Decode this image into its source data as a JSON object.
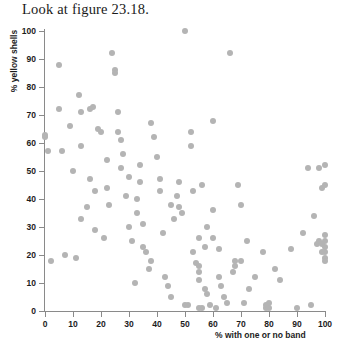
{
  "caption": "Look at figure 23.18.",
  "chart_data": {
    "type": "scatter",
    "title": "",
    "xlabel": "% with one or no band",
    "ylabel": "% yellow shells",
    "xlim": [
      0,
      100
    ],
    "ylim": [
      0,
      100
    ],
    "xticks": [
      0,
      10,
      20,
      30,
      40,
      50,
      60,
      70,
      80,
      90,
      100
    ],
    "yticks": [
      0,
      10,
      20,
      30,
      40,
      50,
      60,
      70,
      80,
      90,
      100
    ],
    "grid": false,
    "legend": null,
    "marker": {
      "shape": "circle",
      "color": "#b4b4b4",
      "size": 6
    },
    "points": [
      [
        0,
        62
      ],
      [
        0,
        63
      ],
      [
        1,
        57
      ],
      [
        2,
        18
      ],
      [
        5,
        72
      ],
      [
        5,
        88
      ],
      [
        6,
        57
      ],
      [
        7,
        20
      ],
      [
        9,
        66
      ],
      [
        10,
        50
      ],
      [
        11,
        19
      ],
      [
        12,
        77
      ],
      [
        13,
        71
      ],
      [
        13,
        59
      ],
      [
        13,
        33
      ],
      [
        15,
        37
      ],
      [
        16,
        47
      ],
      [
        16,
        72
      ],
      [
        17,
        73
      ],
      [
        18,
        43
      ],
      [
        18,
        29
      ],
      [
        19,
        65
      ],
      [
        20,
        64
      ],
      [
        21,
        26
      ],
      [
        22,
        54
      ],
      [
        22,
        44
      ],
      [
        23,
        38
      ],
      [
        24,
        92
      ],
      [
        25,
        86
      ],
      [
        25,
        85
      ],
      [
        26,
        71
      ],
      [
        26,
        64
      ],
      [
        27,
        61
      ],
      [
        27,
        51
      ],
      [
        28,
        56
      ],
      [
        29,
        41
      ],
      [
        30,
        48
      ],
      [
        30,
        30
      ],
      [
        31,
        25
      ],
      [
        32,
        10
      ],
      [
        33,
        35
      ],
      [
        33,
        40
      ],
      [
        34,
        52
      ],
      [
        34,
        46
      ],
      [
        35,
        31
      ],
      [
        35,
        23
      ],
      [
        36,
        21
      ],
      [
        37,
        15
      ],
      [
        38,
        18
      ],
      [
        38,
        67
      ],
      [
        39,
        62
      ],
      [
        40,
        55
      ],
      [
        41,
        47
      ],
      [
        41,
        43
      ],
      [
        42,
        28
      ],
      [
        43,
        12
      ],
      [
        44,
        9
      ],
      [
        45,
        5
      ],
      [
        45,
        38
      ],
      [
        46,
        33
      ],
      [
        47,
        41
      ],
      [
        48,
        46
      ],
      [
        48,
        37
      ],
      [
        49,
        35
      ],
      [
        50,
        100
      ],
      [
        50,
        2
      ],
      [
        51,
        2
      ],
      [
        52,
        59
      ],
      [
        52,
        64
      ],
      [
        53,
        43
      ],
      [
        53,
        21
      ],
      [
        54,
        17
      ],
      [
        55,
        26
      ],
      [
        55,
        16
      ],
      [
        55,
        14
      ],
      [
        55,
        11
      ],
      [
        55,
        1
      ],
      [
        56,
        1
      ],
      [
        56,
        45
      ],
      [
        57,
        23
      ],
      [
        57,
        8
      ],
      [
        58,
        30
      ],
      [
        58,
        6
      ],
      [
        59,
        2
      ],
      [
        60,
        68
      ],
      [
        60,
        36
      ],
      [
        60,
        26
      ],
      [
        61,
        1
      ],
      [
        62,
        22
      ],
      [
        62,
        12
      ],
      [
        63,
        9
      ],
      [
        64,
        5
      ],
      [
        65,
        3
      ],
      [
        66,
        92
      ],
      [
        67,
        14
      ],
      [
        68,
        18
      ],
      [
        68,
        16
      ],
      [
        69,
        45
      ],
      [
        70,
        38
      ],
      [
        70,
        18
      ],
      [
        71,
        3
      ],
      [
        72,
        25
      ],
      [
        73,
        8
      ],
      [
        75,
        12
      ],
      [
        78,
        21
      ],
      [
        79,
        1
      ],
      [
        79,
        2
      ],
      [
        80,
        1
      ],
      [
        80,
        3
      ],
      [
        82,
        15
      ],
      [
        84,
        11
      ],
      [
        88,
        22
      ],
      [
        90,
        1
      ],
      [
        92,
        28
      ],
      [
        94,
        51
      ],
      [
        95,
        2
      ],
      [
        96,
        34
      ],
      [
        97,
        24
      ],
      [
        98,
        51
      ],
      [
        98,
        25
      ],
      [
        99,
        44
      ],
      [
        99,
        24
      ],
      [
        99,
        21
      ],
      [
        100,
        52
      ],
      [
        100,
        45
      ],
      [
        100,
        27
      ],
      [
        100,
        25
      ],
      [
        100,
        23
      ],
      [
        100,
        21
      ],
      [
        100,
        19
      ],
      [
        100,
        18
      ]
    ]
  }
}
